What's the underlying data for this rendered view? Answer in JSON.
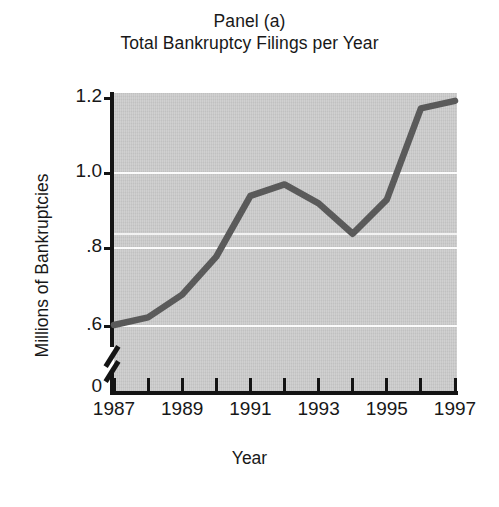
{
  "figure": {
    "title_lines": [
      "Panel (a)",
      "Total Bankruptcy Filings per Year"
    ]
  },
  "chart_data": {
    "type": "line",
    "title": "Panel (a) Total Bankruptcy Filings per Year",
    "panel_label": "Panel (a)",
    "subtitle": "Total Bankruptcy Filings per Year",
    "xlabel": "Year",
    "ylabel": "Millions of Bankruptcies",
    "x": [
      1987,
      1988,
      1989,
      1990,
      1991,
      1992,
      1993,
      1994,
      1995,
      1996,
      1997
    ],
    "values": [
      0.6,
      0.62,
      0.68,
      0.78,
      0.94,
      0.97,
      0.92,
      0.84,
      0.93,
      1.17,
      1.19
    ],
    "series": [
      {
        "name": "Total Bankruptcy Filings",
        "values": [
          0.6,
          0.62,
          0.68,
          0.78,
          0.94,
          0.97,
          0.92,
          0.84,
          0.93,
          1.17,
          1.19
        ]
      }
    ],
    "xlim": [
      1987,
      1997
    ],
    "ylim": [
      0.5,
      1.25
    ],
    "y_axis_break": true,
    "y_axis_break_note": "axis broken between 0 and .6",
    "xticks": [
      1987,
      1988,
      1989,
      1990,
      1991,
      1992,
      1993,
      1994,
      1995,
      1996,
      1997
    ],
    "xtick_labels": [
      "1987",
      "",
      "1989",
      "",
      "1991",
      "",
      "1993",
      "",
      "1995",
      "",
      "1997"
    ],
    "yticks": [
      0,
      0.6,
      0.8,
      1.0,
      1.2
    ],
    "ytick_labels": [
      "0",
      ".6",
      ".8",
      "1.0",
      "1.2"
    ],
    "gridlines": [
      0.6,
      0.8,
      0.9,
      1.0
    ],
    "grid": true,
    "legend": null,
    "legend_position": "none",
    "plot_background_color": "#c9c9c9",
    "gridline_color": "#fbfbfb",
    "line_color": "#5a5a5a",
    "axis_color": "#141414"
  }
}
